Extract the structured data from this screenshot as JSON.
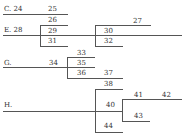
{
  "diagram": {
    "type": "bracket-tree",
    "labels": {
      "c": "C. 24",
      "e": "E. 28",
      "g": "G.",
      "h": "H.",
      "n25": "25",
      "n26": "26",
      "n27": "27",
      "n29": "29",
      "n30": "30",
      "n31": "31",
      "n32": "32",
      "n33": "33",
      "n34": "34",
      "n35": "35",
      "n36": "36",
      "n37": "37",
      "n38": "38",
      "n40": "40",
      "n41": "41",
      "n42": "42",
      "n43": "43",
      "n44": "44"
    }
  }
}
